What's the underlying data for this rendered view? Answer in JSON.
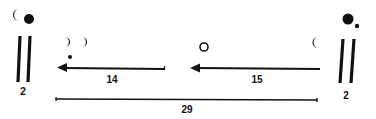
{
  "diagram": {
    "type": "lunar-month-notation",
    "colors": {
      "ink": "#111111",
      "background": "#ffffff"
    },
    "left_marker": {
      "symbols": [
        "waning-crescent",
        "full-dot"
      ],
      "tally": "||",
      "count_label": "2"
    },
    "right_marker": {
      "symbols": [
        "full-dot",
        "small-dot"
      ],
      "tally": "||",
      "count_label": "2"
    },
    "segments": [
      {
        "from": "first-quarter",
        "direction": "left",
        "label": "14",
        "symbols_above": [
          "waxing-crescent",
          "waxing-crescent",
          "small-dot"
        ]
      },
      {
        "from": "waning-crescent",
        "direction": "left",
        "label": "15",
        "symbols_above": [
          "open-circle"
        ],
        "symbols_right": [
          "waning-crescent"
        ]
      }
    ],
    "span": {
      "label": "29"
    }
  }
}
